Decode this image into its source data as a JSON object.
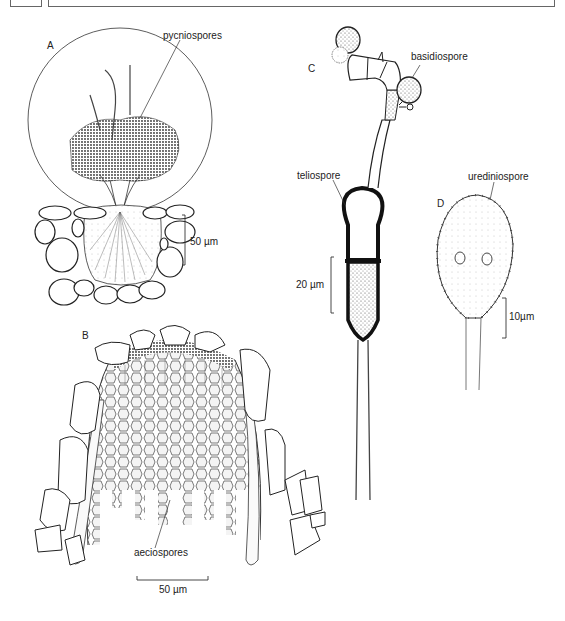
{
  "header": {
    "left_box": "",
    "title_box": ""
  },
  "panels": {
    "A": {
      "letter": "A",
      "label": "pycniospores",
      "scale": "50 µm"
    },
    "B": {
      "letter": "B",
      "label": "aeciospores",
      "scale": "50 µm"
    },
    "C": {
      "letter": "C",
      "labels": [
        "basidiospore",
        "teliospore"
      ],
      "scale": "20 µm"
    },
    "D": {
      "letter": "D",
      "label": "urediniospore",
      "scale": "10µm"
    }
  }
}
